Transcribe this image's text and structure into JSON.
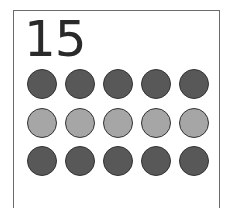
{
  "card": {
    "number": "15",
    "rows": [
      {
        "color": "#585858",
        "count": 5
      },
      {
        "color": "#a6a6a6",
        "count": 5
      },
      {
        "color": "#585858",
        "count": 5
      }
    ],
    "dot_positions": {
      "x": [
        27,
        65,
        103,
        141,
        179
      ],
      "y": [
        69,
        108,
        146
      ]
    }
  }
}
